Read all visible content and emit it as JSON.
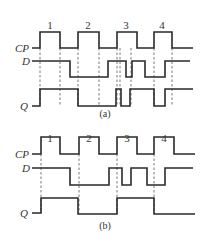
{
  "diagrams": [
    {
      "caption": "(a)",
      "signals": [
        {
          "label": "CP",
          "label_x": 15,
          "label_y": 52,
          "points": "32,48 40,48 40,32 60,32 60,48 78,48 78,32 99,32 99,48 117,48 117,32 137,32 137,48 154,48 154,32 172,32 172,48 193,48"
        },
        {
          "label": "D",
          "label_x": 22,
          "label_y": 65,
          "points": "32,61 70,61 70,77 108,77 108,61 126,61 126,77 132,77 132,61 145,61 145,77 165,77 165,61 190,61"
        },
        {
          "label": "Q",
          "label_x": 20,
          "label_y": 110,
          "points": "32,106 40,106 40,89 78,89 78,106 116,106 116,89 121,89 121,106 130,106 130,89 154,89 154,106 165,106 165,89 193,89"
        }
      ],
      "pulse_numbers": [
        {
          "text": "1",
          "x": 50,
          "y": 29
        },
        {
          "text": "2",
          "x": 88,
          "y": 29
        },
        {
          "text": "3",
          "x": 126,
          "y": 29
        },
        {
          "text": "4",
          "x": 162,
          "y": 29
        }
      ],
      "dashed_x": [
        40,
        60,
        78,
        99,
        117,
        120,
        131,
        154,
        172
      ],
      "dash_y": [
        48,
        106
      ],
      "caption_x": 105,
      "caption_y": 117
    },
    {
      "caption": "(b)",
      "signals": [
        {
          "label": "CP",
          "label_x": 15,
          "label_y": 158,
          "points": "32,154 41,154 41,137 60,137 60,154 79,154 79,137 99,137 99,154 117,154 117,137 137,137 137,154 154,154 154,137 174,137 174,154 195,154"
        },
        {
          "label": "D",
          "label_x": 22,
          "label_y": 172,
          "points": "32,168 70,168 70,185 109,185 109,168 122,168 122,185 131,185 131,168 147,168 147,185 165,185 165,168 193,168"
        },
        {
          "label": "Q",
          "label_x": 20,
          "label_y": 217,
          "points": "32,213 41,213 41,198 78,198 78,214 117,214 117,198 154,198 154,214 195,214"
        }
      ],
      "pulse_numbers": [
        {
          "text": "1",
          "x": 50,
          "y": 142
        },
        {
          "text": "2",
          "x": 89,
          "y": 142
        },
        {
          "text": "3",
          "x": 127,
          "y": 142
        },
        {
          "text": "4",
          "x": 164,
          "y": 142
        }
      ],
      "dashed_x": [
        41,
        79,
        117,
        154
      ],
      "dash_y": [
        154,
        213
      ],
      "caption_x": 105,
      "caption_y": 229
    }
  ]
}
